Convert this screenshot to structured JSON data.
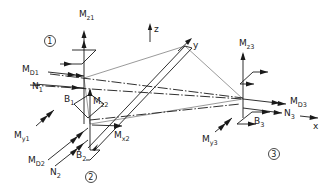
{
  "diagram": {
    "type": "force-moment free-body diagram of a three-node structure",
    "axes": {
      "x": "x",
      "y": "y",
      "z": "z"
    },
    "nodes": [
      {
        "id": "1",
        "label": "1"
      },
      {
        "id": "2",
        "label": "2"
      },
      {
        "id": "3",
        "label": "3"
      }
    ],
    "labels": {
      "Mz1": {
        "main": "M",
        "sub": "z1"
      },
      "MD1": {
        "main": "M",
        "sub": "D1"
      },
      "N1": {
        "main": "N",
        "sub": "1"
      },
      "B1": {
        "main": "B",
        "sub": "1"
      },
      "Mz2": {
        "main": "M",
        "sub": "z2"
      },
      "My1": {
        "main": "M",
        "sub": "y1"
      },
      "Mx2": {
        "main": "M",
        "sub": "x2"
      },
      "MD2": {
        "main": "M",
        "sub": "D2"
      },
      "N2": {
        "main": "N",
        "sub": "2"
      },
      "B2": {
        "main": "B",
        "sub": "2"
      },
      "Mz3": {
        "main": "M",
        "sub": "z3"
      },
      "MD3": {
        "main": "M",
        "sub": "D3"
      },
      "N3": {
        "main": "N",
        "sub": "3"
      },
      "B3": {
        "main": "B",
        "sub": "3"
      },
      "My3": {
        "main": "M",
        "sub": "y3"
      }
    }
  }
}
